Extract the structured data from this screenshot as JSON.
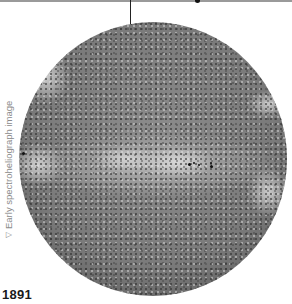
{
  "figure": {
    "caption": "Early spectroheliograph image",
    "caption_icon": "triangle-down-icon",
    "caption_icon_glyph": "▽",
    "year": "1891"
  },
  "sunspots": [
    {
      "left": 22,
      "top": 152,
      "size": 3
    },
    {
      "left": 188,
      "top": 163,
      "size": 3
    },
    {
      "left": 193,
      "top": 162,
      "size": 2
    },
    {
      "left": 198,
      "top": 164,
      "size": 2
    },
    {
      "left": 210,
      "top": 165,
      "size": 3
    },
    {
      "left": 210,
      "top": 162,
      "size": 2
    }
  ]
}
